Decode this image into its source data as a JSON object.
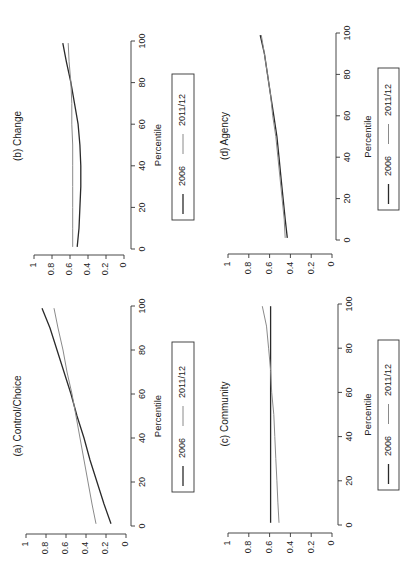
{
  "figure": {
    "orientation": "rotated-90-ccw",
    "colors": {
      "series_2006": "#2a2a2a",
      "series_2011": "#8a8a8a",
      "axis": "#333333",
      "background": "#ffffff"
    }
  },
  "chart_data": [
    {
      "type": "line",
      "title": "(a) Control/Choice",
      "xlabel": "Percentile",
      "ylabel": "",
      "x_ticks": [
        0,
        20,
        40,
        60,
        80,
        100
      ],
      "y_ticks": [
        0,
        0.2,
        0.4,
        0.6,
        0.8,
        1
      ],
      "y_tick_labels": [
        "0",
        "0.2",
        "0.4",
        "0.6",
        "0.8",
        "1"
      ],
      "xlim": [
        0,
        100
      ],
      "ylim": [
        0,
        1
      ],
      "grid": false,
      "legend": {
        "position": "below",
        "entries": [
          "2006",
          "2011/12"
        ]
      },
      "x": [
        1,
        10,
        20,
        30,
        40,
        50,
        60,
        70,
        80,
        90,
        99
      ],
      "series": [
        {
          "name": "2006",
          "values": [
            0.15,
            0.22,
            0.29,
            0.36,
            0.42,
            0.49,
            0.55,
            0.62,
            0.69,
            0.76,
            0.84
          ]
        },
        {
          "name": "2011/12",
          "values": [
            0.3,
            0.34,
            0.38,
            0.42,
            0.46,
            0.5,
            0.54,
            0.59,
            0.63,
            0.68,
            0.72
          ]
        }
      ]
    },
    {
      "type": "line",
      "title": "(b) Change",
      "xlabel": "Percentile",
      "ylabel": "",
      "x_ticks": [
        0,
        20,
        40,
        60,
        80,
        100
      ],
      "y_ticks": [
        0,
        0.2,
        0.4,
        0.6,
        0.8,
        1
      ],
      "y_tick_labels": [
        "0",
        "0.2",
        "0.4",
        "0.6",
        "0.8",
        "1"
      ],
      "xlim": [
        0,
        100
      ],
      "ylim": [
        0,
        1
      ],
      "grid": false,
      "legend": {
        "position": "below",
        "entries": [
          "2006",
          "2011/12"
        ]
      },
      "x": [
        1,
        10,
        20,
        30,
        40,
        50,
        60,
        70,
        80,
        90,
        99
      ],
      "series": [
        {
          "name": "2006",
          "values": [
            0.52,
            0.5,
            0.49,
            0.48,
            0.48,
            0.49,
            0.51,
            0.55,
            0.59,
            0.64,
            0.68
          ]
        },
        {
          "name": "2011/12",
          "values": [
            0.57,
            0.57,
            0.57,
            0.57,
            0.57,
            0.57,
            0.58,
            0.58,
            0.59,
            0.61,
            0.62
          ]
        }
      ]
    },
    {
      "type": "line",
      "title": "(c) Community",
      "xlabel": "Percentile",
      "ylabel": "",
      "x_ticks": [
        0,
        20,
        40,
        60,
        80,
        100
      ],
      "y_ticks": [
        0,
        0.2,
        0.4,
        0.6,
        0.8,
        1
      ],
      "y_tick_labels": [
        "0",
        "0.2",
        "0.4",
        "0.6",
        "0.8",
        "1"
      ],
      "xlim": [
        0,
        100
      ],
      "ylim": [
        0,
        1
      ],
      "grid": false,
      "legend": {
        "position": "below",
        "entries": [
          "2006",
          "2011/12"
        ]
      },
      "x": [
        1,
        10,
        20,
        30,
        40,
        50,
        60,
        70,
        80,
        90,
        99
      ],
      "series": [
        {
          "name": "2006",
          "values": [
            0.59,
            0.59,
            0.59,
            0.59,
            0.59,
            0.59,
            0.59,
            0.59,
            0.59,
            0.59,
            0.59
          ]
        },
        {
          "name": "2011/12",
          "values": [
            0.51,
            0.52,
            0.53,
            0.54,
            0.55,
            0.56,
            0.58,
            0.59,
            0.61,
            0.63,
            0.67
          ]
        }
      ]
    },
    {
      "type": "line",
      "title": "(d) Agency",
      "xlabel": "Percentile",
      "ylabel": "",
      "x_ticks": [
        0,
        20,
        40,
        60,
        80,
        100
      ],
      "y_ticks": [
        0,
        0.2,
        0.4,
        0.6,
        0.8,
        1
      ],
      "y_tick_labels": [
        "0",
        "0.2",
        "0.4",
        "0.6",
        "0.8",
        "1"
      ],
      "xlim": [
        0,
        100
      ],
      "ylim": [
        0,
        1
      ],
      "grid": false,
      "legend": {
        "position": "below",
        "entries": [
          "2006",
          "2011/12"
        ]
      },
      "x": [
        1,
        10,
        20,
        30,
        40,
        50,
        60,
        70,
        80,
        90,
        99
      ],
      "series": [
        {
          "name": "2006",
          "values": [
            0.43,
            0.45,
            0.47,
            0.49,
            0.51,
            0.53,
            0.56,
            0.59,
            0.62,
            0.65,
            0.69
          ]
        },
        {
          "name": "2011/12",
          "values": [
            0.45,
            0.46,
            0.48,
            0.5,
            0.52,
            0.54,
            0.57,
            0.59,
            0.62,
            0.65,
            0.68
          ]
        }
      ]
    }
  ],
  "panels_layout": [
    {
      "chart_index": 0,
      "xaxis_x": 131,
      "p0_y": 526,
      "p100_y": 306,
      "vaxis_y": 534,
      "v0_x": 126,
      "v1_x": 26,
      "title_x": 18,
      "title_y": 416,
      "label_x": 158,
      "legend": {
        "x": 172,
        "y": 342,
        "w": 22,
        "h": 150
      }
    },
    {
      "chart_index": 1,
      "xaxis_x": 131,
      "p0_y": 249,
      "p100_y": 41,
      "vaxis_y": 255,
      "v0_x": 124,
      "v1_x": 34,
      "title_x": 18,
      "title_y": 136,
      "label_x": 158,
      "legend": {
        "x": 172,
        "y": 74,
        "w": 22,
        "h": 146
      }
    },
    {
      "chart_index": 2,
      "xaxis_x": 338,
      "p0_y": 525,
      "p100_y": 304,
      "vaxis_y": 533,
      "v0_x": 332,
      "v1_x": 228,
      "title_x": 225,
      "title_y": 414,
      "label_x": 368,
      "legend": {
        "x": 378,
        "y": 340,
        "w": 21,
        "h": 150
      }
    },
    {
      "chart_index": 3,
      "xaxis_x": 336,
      "p0_y": 240,
      "p100_y": 33,
      "vaxis_y": 254,
      "v0_x": 332,
      "v1_x": 228,
      "title_x": 225,
      "title_y": 136,
      "label_x": 368,
      "legend": {
        "x": 378,
        "y": 68,
        "w": 21,
        "h": 142
      }
    }
  ]
}
